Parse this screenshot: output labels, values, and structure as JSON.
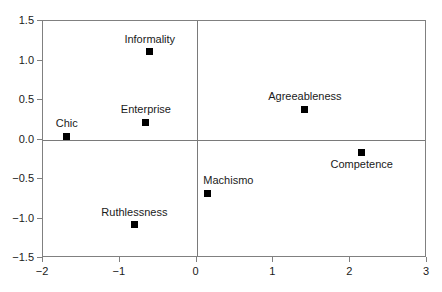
{
  "chart_data": {
    "type": "scatter",
    "title": "",
    "subtitle": "",
    "xlabel": "",
    "ylabel": "",
    "xlim": [
      -2,
      3
    ],
    "ylim": [
      -1.5,
      1.5
    ],
    "grid": false,
    "legend": null,
    "xticks": [
      "−2",
      "−1",
      "0",
      "1",
      "2",
      "3"
    ],
    "xtick_values": [
      -2,
      -1,
      0,
      1,
      2,
      3
    ],
    "yticks": [
      "1.5",
      "1.0",
      "0.5",
      "0.0",
      "−0.5",
      "−1.0",
      "−1.5"
    ],
    "ytick_values": [
      1.5,
      1.0,
      0.5,
      0.0,
      -0.5,
      -1.0,
      -1.5
    ],
    "marker": "filled-square",
    "marker_color": "#000000",
    "reference_lines": [
      {
        "axis": "y",
        "value": 0
      },
      {
        "axis": "x",
        "value": 0
      }
    ],
    "points": [
      {
        "label": "Chic",
        "x": -1.69,
        "y": 0.04,
        "label_pos": "above"
      },
      {
        "label": "Informality",
        "x": -0.61,
        "y": 1.11,
        "label_pos": "above"
      },
      {
        "label": "Enterprise",
        "x": -0.66,
        "y": 0.22,
        "label_pos": "above"
      },
      {
        "label": "Agreeableness",
        "x": 1.41,
        "y": 0.38,
        "label_pos": "above"
      },
      {
        "label": "Competence",
        "x": 2.15,
        "y": -0.16,
        "label_pos": "below"
      },
      {
        "label": "Machismo",
        "x": 0.14,
        "y": -0.68,
        "label_pos": "above-left"
      },
      {
        "label": "Ruthlessness",
        "x": -0.81,
        "y": -1.08,
        "label_pos": "above"
      }
    ]
  },
  "colors": {
    "axis": "#808080",
    "zero_line": "#7a7a7a",
    "marker": "#000000",
    "text": "#1a1a1a",
    "background": "#ffffff"
  }
}
